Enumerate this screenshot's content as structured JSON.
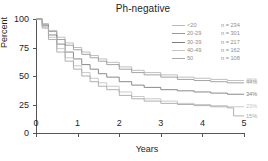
{
  "chart_data": {
    "type": "line",
    "title": "Ph-negative",
    "xlabel": "Years",
    "ylabel": "Percent",
    "xlim": [
      0,
      5
    ],
    "ylim": [
      0,
      100
    ],
    "xticks": [
      "0",
      "1",
      "2",
      "3",
      "4",
      "5"
    ],
    "yticks": [
      "0",
      "25",
      "50",
      "75",
      "100"
    ],
    "grid": false,
    "legend_position": "top-right",
    "series": [
      {
        "name": "<20",
        "n_label": "n = 234",
        "n": 234,
        "color": "#b9b9b9",
        "end_label": "46%",
        "x": [
          0,
          0.15,
          0.3,
          0.5,
          0.7,
          0.9,
          1.1,
          1.3,
          1.5,
          1.7,
          2.0,
          2.3,
          2.6,
          3.0,
          3.4,
          3.8,
          4.2,
          4.6,
          5.0
        ],
        "values": [
          100,
          96,
          90,
          84,
          79,
          75,
          71,
          68,
          65,
          62,
          58,
          55,
          53,
          51,
          49,
          48,
          47,
          46,
          46
        ]
      },
      {
        "name": "20-29",
        "n_label": "n = 301",
        "n": 301,
        "color": "#9a9a9a",
        "end_label": "44%",
        "x": [
          0,
          0.15,
          0.3,
          0.5,
          0.7,
          0.9,
          1.1,
          1.3,
          1.5,
          1.7,
          2.0,
          2.3,
          2.6,
          3.0,
          3.4,
          3.8,
          4.2,
          4.6,
          5.0
        ],
        "values": [
          100,
          95,
          89,
          82,
          77,
          73,
          69,
          66,
          63,
          60,
          56,
          53,
          51,
          49,
          47,
          46,
          45,
          44,
          44
        ]
      },
      {
        "name": "30-39",
        "n_label": "n = 217",
        "n": 217,
        "color": "#7d7d7d",
        "end_label": "34%",
        "x": [
          0,
          0.15,
          0.3,
          0.5,
          0.7,
          0.9,
          1.1,
          1.3,
          1.5,
          1.7,
          2.0,
          2.3,
          2.6,
          3.0,
          3.4,
          3.8,
          4.2,
          4.6,
          5.0
        ],
        "values": [
          100,
          94,
          86,
          78,
          71,
          65,
          60,
          56,
          52,
          49,
          45,
          42,
          40,
          38,
          37,
          36,
          35,
          34,
          34
        ]
      },
      {
        "name": "40-49",
        "n_label": "n = 162",
        "n": 162,
        "color": "#c4c4c4",
        "end_label": "23%",
        "x": [
          0,
          0.15,
          0.3,
          0.5,
          0.7,
          0.9,
          1.1,
          1.3,
          1.5,
          1.7,
          2.0,
          2.3,
          2.6,
          3.0,
          3.4,
          3.8,
          4.2,
          4.6,
          5.0
        ],
        "values": [
          100,
          93,
          84,
          74,
          66,
          59,
          53,
          48,
          44,
          41,
          36,
          32,
          30,
          28,
          26,
          25,
          24,
          23,
          23
        ]
      },
      {
        "name": "50",
        "n_label": "n = 108",
        "n": 108,
        "color": "#a8a8a8",
        "end_label": "15%",
        "x": [
          0,
          0.15,
          0.3,
          0.5,
          0.7,
          0.9,
          1.1,
          1.3,
          1.5,
          1.7,
          2.0,
          2.3,
          2.6,
          3.0,
          3.4,
          3.8,
          4.2,
          4.6,
          4.75,
          5.0
        ],
        "values": [
          100,
          92,
          82,
          71,
          63,
          56,
          50,
          45,
          41,
          38,
          33,
          30,
          28,
          26,
          25,
          24,
          23,
          22,
          15,
          15
        ]
      }
    ]
  }
}
